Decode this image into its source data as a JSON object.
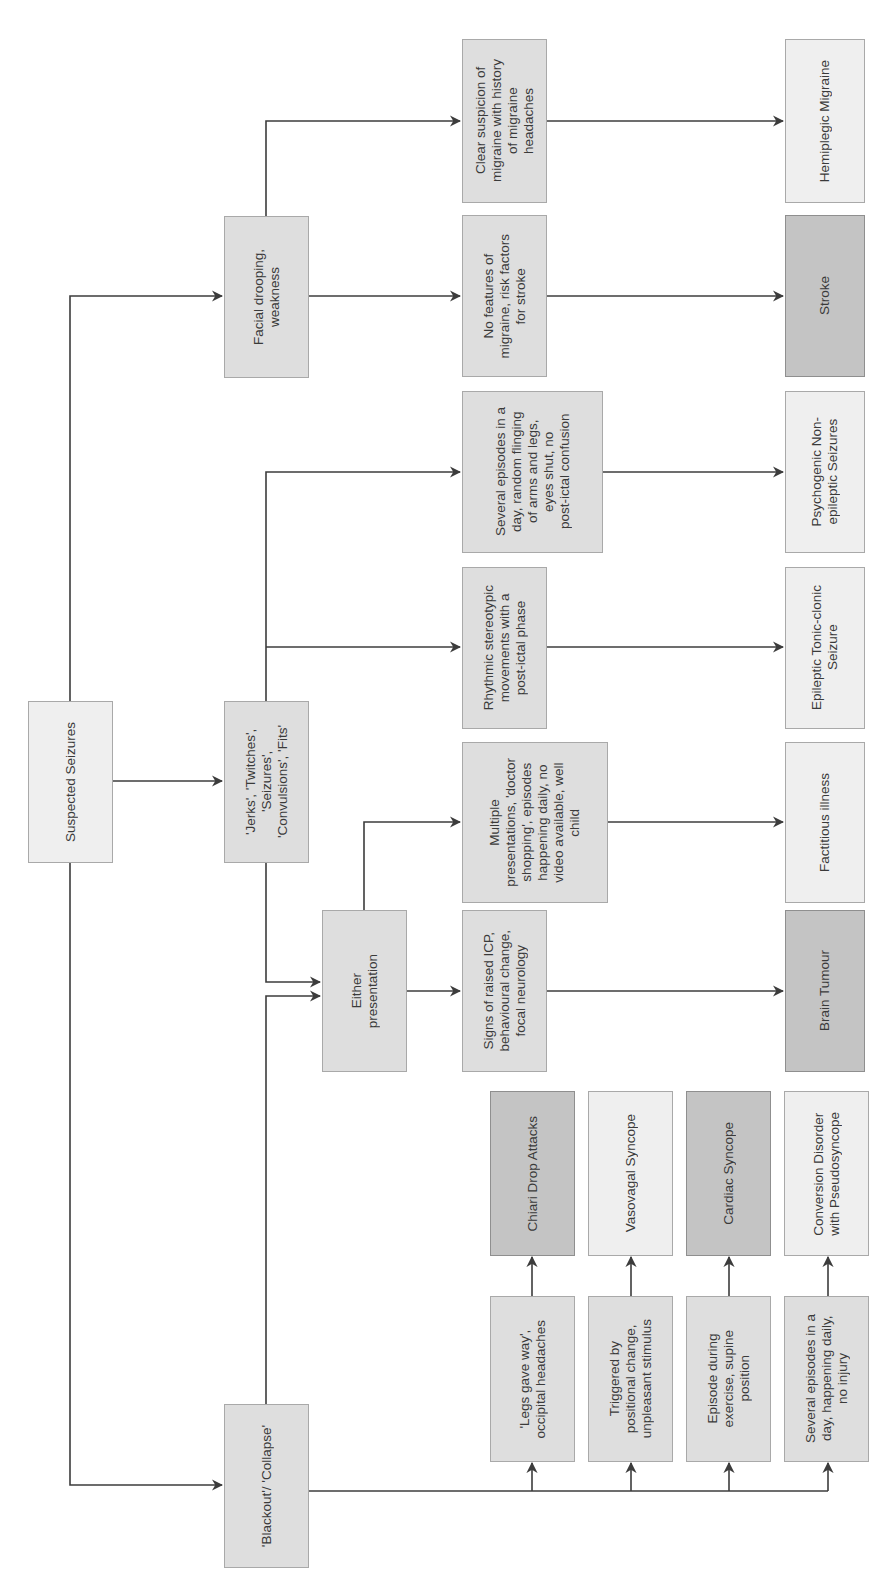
{
  "diagram": {
    "orientation": "rotated 90deg counter-clockwise (text reads bottom-to-top)",
    "colors": {
      "line": "#3c3c3c",
      "light_fill": "#efefef",
      "mid_fill": "#dedede",
      "dark_fill": "#c4c4c4",
      "border": "#a9a9a9"
    },
    "nodes": {
      "root": "Suspected Seizures",
      "facial": "Facial drooping,\nweakness",
      "jerks": "'Jerks', 'Twitches',\n'Seizures',\n'Convulsions', 'Fits'",
      "blackout": "'Blackout'/ 'Collapse'",
      "either": "Either\npresentation",
      "clear_migraine": "Clear suspicion of\nmigraine with history\nof migraine\nheadaches",
      "no_features": "No features of\nmigraine, risk factors\nfor stroke",
      "several_flinging": "Several episodes in a\nday, random flinging\nof arms and legs,\neyes shut, no\npost-ictal confusion",
      "rhythmic": "Rhythmic stereotypic\nmovements with a\npost-ictal phase",
      "multiple": "Multiple\npresentations, 'doctor\nshopping', episodes\nhappening daily, no\nvideo available, well\nchild",
      "signs_icp": "Signs of raised ICP,\nbehavioural change,\nfocal neurology",
      "hemiplegic": "Hemiplegic Migraine",
      "stroke": "Stroke",
      "pnes": "Psychogenic Non-\nepileptic Seizures",
      "epileptic": "Epileptic Tonic-clonic\nSeizure",
      "factitious": "Factitious illness",
      "brain_tumour": "Brain Tumour",
      "legs_gave_way": "'Legs gave way',\noccipital headaches",
      "positional": "Triggered by\npositional change,\nunpleasant stimulus",
      "exercise": "Episode during\nexercise, supine\nposition",
      "several_daily": "Several episodes in a\nday, happening daily,\nno injury",
      "chiari": "Chiari Drop Attacks",
      "vasovagal": "Vasovagal Syncope",
      "cardiac": "Cardiac Syncope",
      "conversion": "Conversion Disorder\nwith Pseudosyncope"
    },
    "edges": [
      [
        "root",
        "facial"
      ],
      [
        "root",
        "jerks"
      ],
      [
        "root",
        "blackout"
      ],
      [
        "facial",
        "clear_migraine"
      ],
      [
        "facial",
        "no_features"
      ],
      [
        "jerks",
        "several_flinging"
      ],
      [
        "jerks",
        "rhythmic"
      ],
      [
        "jerks",
        "either"
      ],
      [
        "blackout",
        "either"
      ],
      [
        "either",
        "multiple"
      ],
      [
        "either",
        "signs_icp"
      ],
      [
        "clear_migraine",
        "hemiplegic"
      ],
      [
        "no_features",
        "stroke"
      ],
      [
        "several_flinging",
        "pnes"
      ],
      [
        "rhythmic",
        "epileptic"
      ],
      [
        "multiple",
        "factitious"
      ],
      [
        "signs_icp",
        "brain_tumour"
      ],
      [
        "blackout",
        "legs_gave_way"
      ],
      [
        "blackout",
        "positional"
      ],
      [
        "blackout",
        "exercise"
      ],
      [
        "blackout",
        "several_daily"
      ],
      [
        "legs_gave_way",
        "chiari"
      ],
      [
        "positional",
        "vasovagal"
      ],
      [
        "exercise",
        "cardiac"
      ],
      [
        "several_daily",
        "conversion"
      ]
    ]
  }
}
